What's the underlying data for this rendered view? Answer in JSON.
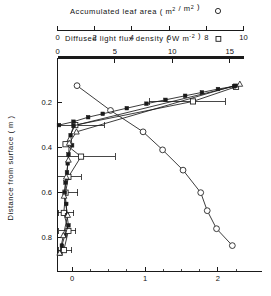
{
  "chart_data": {
    "type": "line",
    "title": "",
    "ylabel": "Distance from surface ( m )",
    "ylim": [
      0.0,
      0.95
    ],
    "yticks": [
      0.2,
      0.4,
      0.6,
      0.8
    ],
    "ytick_labels": [
      "0.2",
      "0.4",
      "0.6",
      "0.8"
    ],
    "grid": false,
    "legend_position": "top-inline",
    "axes": [
      {
        "id": "top1",
        "label": "Accumulated leaf area ( m2 / m2 )",
        "label_plain": "Accumulated leaf area",
        "units": "m2 / m2",
        "symbol": "open-circle",
        "range": [
          0,
          10
        ],
        "ticks": [
          0,
          2,
          4,
          6,
          8,
          10
        ],
        "tick_labels": [
          "0",
          "2",
          "4",
          "6",
          "8",
          "10"
        ]
      },
      {
        "id": "top2",
        "label": "Diffused light flux density ( W m-2 )",
        "label_plain": "Diffused light flux density",
        "units": "W m-2",
        "symbol": "open-square",
        "range": [
          0,
          16.2
        ],
        "ticks": [
          0,
          5,
          10,
          15
        ],
        "tick_labels": [
          "0",
          "5",
          "10",
          "15"
        ]
      },
      {
        "id": "bottom",
        "label": "",
        "range": [
          -0.2,
          2.35
        ],
        "ticks": [
          0,
          1,
          2
        ],
        "tick_labels": [
          "0",
          "1",
          "2"
        ],
        "minor_ticks": [
          0.25,
          0.5,
          0.75,
          1.25,
          1.5,
          1.75,
          2.25
        ]
      }
    ],
    "series": [
      {
        "name": "Accumulated leaf area",
        "marker": "open-circle",
        "axis": "top1",
        "points": [
          {
            "x": 1.05,
            "y": 0.125
          },
          {
            "x": 2.85,
            "y": 0.235
          },
          {
            "x": 4.6,
            "y": 0.33
          },
          {
            "x": 5.65,
            "y": 0.41
          },
          {
            "x": 6.75,
            "y": 0.5
          },
          {
            "x": 7.7,
            "y": 0.6
          },
          {
            "x": 8.05,
            "y": 0.68
          },
          {
            "x": 8.55,
            "y": 0.76
          },
          {
            "x": 9.4,
            "y": 0.835
          }
        ]
      },
      {
        "name": "Diffused light flux density",
        "marker": "open-square",
        "axis": "top2",
        "points": [
          {
            "x": 15.55,
            "y": 0.13
          },
          {
            "x": 11.8,
            "y": 0.195
          },
          {
            "x": 1.55,
            "y": 0.3
          },
          {
            "x": 0.7,
            "y": 0.385
          },
          {
            "x": 2.05,
            "y": 0.44
          },
          {
            "x": 0.95,
            "y": 0.53
          },
          {
            "x": 0.7,
            "y": 0.6
          },
          {
            "x": 0.55,
            "y": 0.69
          },
          {
            "x": 0.95,
            "y": 0.77
          },
          {
            "x": 0.55,
            "y": 0.855
          }
        ],
        "error_bars": [
          {
            "y": 0.195,
            "lo": 8.0,
            "hi": 14.6
          },
          {
            "y": 0.3,
            "lo": 0.0,
            "hi": 4.05
          },
          {
            "y": 0.44,
            "lo": 0.0,
            "hi": 5.05
          },
          {
            "y": 0.53,
            "lo": 0.0,
            "hi": 2.05
          },
          {
            "y": 0.6,
            "lo": 0.0,
            "hi": 1.75
          },
          {
            "y": 0.69,
            "lo": 0.05,
            "hi": 1.4
          },
          {
            "y": 0.77,
            "lo": 0.1,
            "hi": 1.6
          },
          {
            "y": 0.855,
            "lo": 0.05,
            "hi": 1.25
          }
        ]
      },
      {
        "name": "Direct flux upper",
        "marker": "filled-square",
        "axis": "bottom",
        "points": [
          {
            "x": -0.18,
            "y": 0.3
          },
          {
            "x": 0.02,
            "y": 0.285
          },
          {
            "x": 0.22,
            "y": 0.265
          },
          {
            "x": 0.42,
            "y": 0.25
          },
          {
            "x": 0.75,
            "y": 0.225
          },
          {
            "x": 1.02,
            "y": 0.205
          },
          {
            "x": 1.28,
            "y": 0.188
          },
          {
            "x": 1.55,
            "y": 0.17
          },
          {
            "x": 1.78,
            "y": 0.155
          },
          {
            "x": 2.0,
            "y": 0.14
          },
          {
            "x": 2.22,
            "y": 0.128
          }
        ]
      },
      {
        "name": "Direct flux lower",
        "marker": "filled-square",
        "axis": "bottom",
        "points": [
          {
            "x": 2.24,
            "y": 0.126
          },
          {
            "x": 0.02,
            "y": 0.303
          },
          {
            "x": -0.02,
            "y": 0.345
          },
          {
            "x": 0.0,
            "y": 0.39
          },
          {
            "x": -0.05,
            "y": 0.43
          },
          {
            "x": -0.06,
            "y": 0.47
          },
          {
            "x": -0.07,
            "y": 0.51
          },
          {
            "x": -0.09,
            "y": 0.555
          },
          {
            "x": -0.1,
            "y": 0.6
          },
          {
            "x": -0.08,
            "y": 0.65
          },
          {
            "x": -0.07,
            "y": 0.7
          },
          {
            "x": -0.05,
            "y": 0.745
          },
          {
            "x": -0.1,
            "y": 0.79
          },
          {
            "x": -0.14,
            "y": 0.835
          },
          {
            "x": -0.16,
            "y": 0.872
          }
        ]
      },
      {
        "name": "Open triangle profile",
        "marker": "open-triangle",
        "axis": "bottom",
        "points": [
          {
            "x": 2.3,
            "y": 0.118
          },
          {
            "x": 0.06,
            "y": 0.33
          },
          {
            "x": -0.04,
            "y": 0.38
          },
          {
            "x": -0.05,
            "y": 0.455
          },
          {
            "x": -0.08,
            "y": 0.53
          },
          {
            "x": -0.11,
            "y": 0.615
          },
          {
            "x": -0.06,
            "y": 0.7
          },
          {
            "x": -0.12,
            "y": 0.79
          },
          {
            "x": -0.17,
            "y": 0.868
          }
        ]
      }
    ]
  },
  "legend": {
    "leaf_area_symbol": "open-circle",
    "light_flux_symbol": "open-square"
  },
  "labels": {
    "axis_top1_pre": "Accumulated leaf area ( m",
    "axis_top1_sup1": "2",
    "axis_top1_mid": " / m",
    "axis_top1_sup2": "2",
    "axis_top1_post": " )",
    "axis_top2_pre": "Diffused light flux density ( W m",
    "axis_top2_sup": "-2",
    "axis_top2_post": " )",
    "yaxis": "Distance from surface ( m )"
  }
}
